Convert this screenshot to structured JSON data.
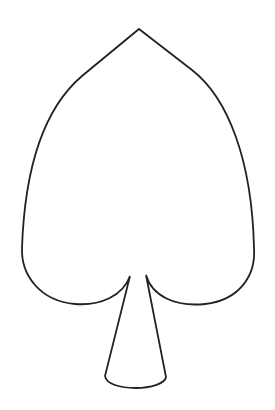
{
  "figure": {
    "shape": "spade-outline-icon",
    "stroke_color": "#222222",
    "fill_color": "#ffffff",
    "background": "#ffffff"
  }
}
